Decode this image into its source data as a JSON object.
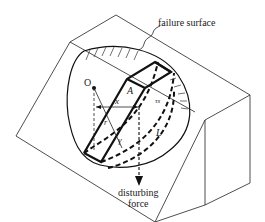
{
  "diagram": {
    "labels": {
      "failure_surface": "failure surface",
      "center": "O",
      "area": "A",
      "moment_arm": "x",
      "radius": "r",
      "shear_stress": "τs",
      "unit_weight": "γ",
      "arc_length": "L",
      "force_line1": "disturbing",
      "force_line2": "force"
    },
    "colors": {
      "line": "#111111",
      "background": "#ffffff"
    }
  }
}
